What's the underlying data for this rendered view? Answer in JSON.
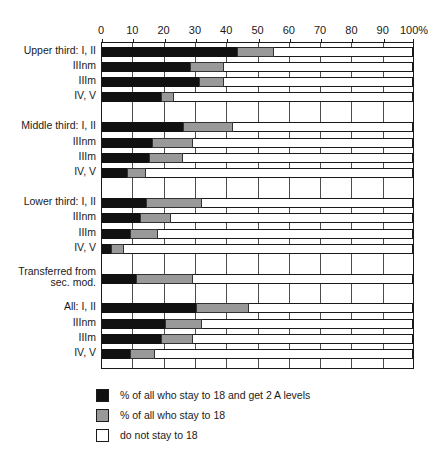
{
  "chart_data": {
    "type": "bar",
    "orientation": "horizontal",
    "stacked": true,
    "title": "",
    "xlabel": "",
    "ylabel": "",
    "xlim": [
      0,
      100
    ],
    "xticks": [
      0,
      10,
      20,
      30,
      40,
      50,
      60,
      70,
      80,
      90,
      100
    ],
    "xticklabels": [
      "0",
      "10",
      "20",
      "30",
      "40",
      "50",
      "60",
      "70",
      "80",
      "90",
      "100%"
    ],
    "grid": true,
    "legend_position": "bottom",
    "colors": {
      "stay_and_2a_levels": "#111111",
      "stay_to_18": "#999999",
      "do_not_stay": "#ffffff",
      "axis": "#1a1a1a",
      "gridline": "#4d4d4d"
    },
    "legend": [
      "% of all who stay to 18 and get 2 A levels",
      "% of all who stay to 18",
      "do not stay to 18"
    ],
    "series": [
      {
        "name": "% of all who stay to 18 and get 2 A levels",
        "color": "#111111"
      },
      {
        "name": "% of all who stay to 18",
        "color": "#999999"
      },
      {
        "name": "do not stay to 18",
        "color": "#ffffff"
      }
    ],
    "categories": [
      "Upper third: I, II",
      "IIInm",
      "IIIm",
      "IV, V",
      "Middle third: I, II",
      "IIInm",
      "IIIm",
      "IV, V",
      "Lower third: I, II",
      "IIInm",
      "IIIm",
      "IV, V",
      "Transferred from\nsec. mod.",
      "All: I, II",
      "IIInm",
      "IIIm",
      "IV, V"
    ],
    "rows": [
      {
        "label": "Upper third: I, II",
        "black": 43,
        "gray_end": 55,
        "gap_before": false
      },
      {
        "label": "IIInm",
        "black": 28,
        "gray_end": 39,
        "gap_before": false
      },
      {
        "label": "IIIm",
        "black": 31,
        "gray_end": 39,
        "gap_before": false
      },
      {
        "label": "IV, V",
        "black": 19,
        "gray_end": 23,
        "gap_before": false
      },
      {
        "label": "Middle third: I, II",
        "black": 26,
        "gray_end": 42,
        "gap_before": true
      },
      {
        "label": "IIInm",
        "black": 16,
        "gray_end": 29,
        "gap_before": false
      },
      {
        "label": "IIIm",
        "black": 15,
        "gray_end": 26,
        "gap_before": false
      },
      {
        "label": "IV, V",
        "black": 8,
        "gray_end": 14,
        "gap_before": false
      },
      {
        "label": "Lower third: I, II",
        "black": 14,
        "gray_end": 32,
        "gap_before": true
      },
      {
        "label": "IIInm",
        "black": 12,
        "gray_end": 22,
        "gap_before": false
      },
      {
        "label": "IIIm",
        "black": 9,
        "gray_end": 18,
        "gap_before": false
      },
      {
        "label": "IV, V",
        "black": 3,
        "gray_end": 7,
        "gap_before": false
      },
      {
        "label": "Transferred from\nsec. mod.",
        "black": 11,
        "gray_end": 29,
        "gap_before": true
      },
      {
        "label": "All: I, II",
        "black": 30,
        "gray_end": 47,
        "gap_before": true
      },
      {
        "label": "IIInm",
        "black": 20,
        "gray_end": 32,
        "gap_before": false
      },
      {
        "label": "IIIm",
        "black": 19,
        "gray_end": 29,
        "gap_before": false
      },
      {
        "label": "IV, V",
        "black": 9,
        "gray_end": 17,
        "gap_before": false
      }
    ]
  }
}
